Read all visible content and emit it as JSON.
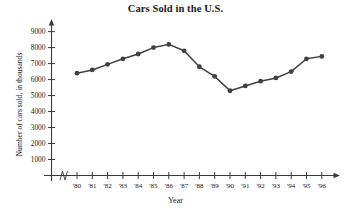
{
  "chart_data": {
    "type": "line",
    "title": "Cars Sold in the U.S.",
    "xlabel": "Year",
    "ylabel": "Number of cars sold, in thousands",
    "categories": [
      "'80",
      "'81",
      "'82",
      "'83",
      "'84",
      "'85",
      "'86",
      "'87",
      "'88",
      "'89",
      "'90",
      "'91",
      "'92",
      "'93",
      "'94",
      "'95",
      "'96"
    ],
    "values": [
      6400,
      6600,
      6950,
      7300,
      7600,
      8000,
      8200,
      7800,
      6800,
      6200,
      5300,
      5600,
      5900,
      6100,
      6500,
      7300,
      7450
    ],
    "ylim": [
      0,
      9600
    ],
    "yticks": [
      1000,
      2000,
      3000,
      4000,
      5000,
      6000,
      7000,
      8000,
      9000
    ],
    "ytick_labels": [
      "1000",
      "2000",
      "3000",
      "4000",
      "5000",
      "6000",
      "7000",
      "8000",
      "9000"
    ],
    "grid": false,
    "legend": false,
    "axis_break": true,
    "series_color": "#404040",
    "marker": "circle"
  }
}
